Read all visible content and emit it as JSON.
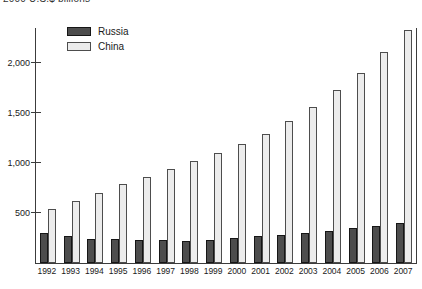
{
  "title": "2000 U.S.$ billions",
  "legend": {
    "items": [
      {
        "label": "Russia",
        "color": "#4d4d4d"
      },
      {
        "label": "China",
        "color": "#ececec"
      }
    ]
  },
  "colors": {
    "russia_bar": "#4d4d4d",
    "russia_border": "#161616",
    "china_bar": "#ececec",
    "china_border": "#4d4d4d",
    "axis": "#3c3c3c",
    "background": "#ffffff"
  },
  "chart_data": {
    "type": "bar",
    "title": "2000 U.S.$ billions",
    "categories": [
      "1992",
      "1993",
      "1994",
      "1995",
      "1996",
      "1997",
      "1998",
      "1999",
      "2000",
      "2001",
      "2002",
      "2003",
      "2004",
      "2005",
      "2006",
      "2007"
    ],
    "series": [
      {
        "name": "Russia",
        "color": "#4d4d4d",
        "values": [
          300,
          275,
          245,
          240,
          230,
          230,
          220,
          230,
          255,
          270,
          285,
          305,
          325,
          350,
          370,
          400
        ]
      },
      {
        "name": "China",
        "color": "#ececec",
        "values": [
          540,
          620,
          705,
          790,
          865,
          945,
          1020,
          1100,
          1195,
          1290,
          1420,
          1560,
          1730,
          1900,
          2110,
          2330
        ]
      }
    ],
    "xlabel": "",
    "ylabel": "",
    "ylim": [
      0,
      2350
    ],
    "yticks": [
      500,
      1000,
      1500,
      2000
    ],
    "ytick_labels": [
      "500",
      "1,000",
      "1,500",
      "2,000"
    ],
    "grid": false,
    "legend_position": "top-left-inside"
  }
}
